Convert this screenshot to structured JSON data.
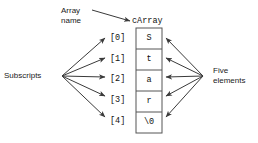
{
  "diagram": {
    "title_labels": {
      "array_name": "Array\nname",
      "subscripts": "Subscripts",
      "five_elements": "Five\nelements",
      "array_identifier": "cArray"
    },
    "array": {
      "name": "cArray",
      "cells": [
        {
          "subscript": "[0]",
          "value": "S"
        },
        {
          "subscript": "[1]",
          "value": "t"
        },
        {
          "subscript": "[2]",
          "value": "a"
        },
        {
          "subscript": "[3]",
          "value": "r"
        },
        {
          "subscript": "[4]",
          "value": "\\0"
        }
      ]
    },
    "colors": {
      "stroke": "#3a3a3a",
      "box_border": "#555555",
      "text": "#111111",
      "background": "#ffffff"
    }
  }
}
